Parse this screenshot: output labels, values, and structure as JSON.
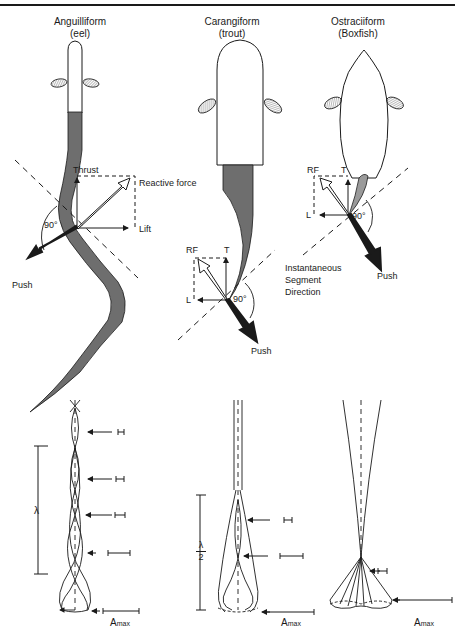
{
  "columns": [
    {
      "name": "Anguilliform",
      "example": "(eel)"
    },
    {
      "name": "Carangiform",
      "example": "(trout)"
    },
    {
      "name": "Ostraciiform",
      "example": "(Boxfish)"
    }
  ],
  "force_labels": {
    "thrust": "Thrust",
    "reactive_force": "Reactive force",
    "lift": "Lift",
    "push": "Push",
    "angle": "90°",
    "rf": "RF",
    "t": "T",
    "l": "L"
  },
  "segment_note": [
    "Instantaneous",
    "Segment",
    "Direction"
  ],
  "wave_labels": {
    "wavelength": "λ",
    "half_wavelength_num": "λ",
    "half_wavelength_den": "2",
    "amax": "A",
    "amax_sub": "max"
  },
  "colors": {
    "ink": "#1a1a1a",
    "shaded_body": "#6e6e6e",
    "background": "#ffffff"
  }
}
